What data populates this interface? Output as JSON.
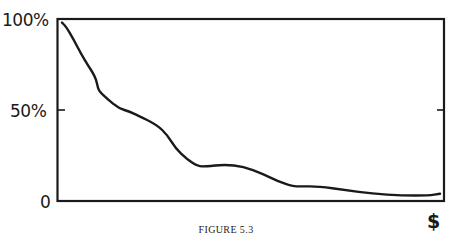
{
  "chart_data": {
    "type": "line",
    "title": "",
    "caption": "FIGURE 5.3",
    "xlabel": "$",
    "ylabel": "",
    "y_ticks": [
      "0",
      "50%",
      "100%"
    ],
    "ylim": [
      0,
      100
    ],
    "x_ticks": [],
    "grid": false,
    "legend": null,
    "series": [
      {
        "name": "curve",
        "x": [
          0,
          1,
          3,
          5,
          7,
          8,
          9,
          9.5,
          10,
          12,
          15,
          18,
          20,
          25,
          28,
          30,
          33,
          36,
          38,
          43,
          48,
          53,
          57,
          61,
          63,
          68,
          75,
          82,
          90,
          97,
          100
        ],
        "values": [
          98,
          96,
          89,
          81,
          74,
          71,
          67,
          62,
          60,
          56,
          51,
          49,
          47,
          42,
          36,
          29,
          23,
          19,
          19,
          20,
          19,
          15,
          11,
          8,
          8,
          8,
          6,
          4,
          3,
          3,
          4
        ]
      }
    ]
  },
  "labels": {
    "y100": "100%",
    "y50": "50%",
    "y0": "0",
    "x_unit": "$",
    "caption": "FIGURE 5.3"
  },
  "colors": {
    "ink": "#1a1a1a",
    "background": "#ffffff"
  }
}
